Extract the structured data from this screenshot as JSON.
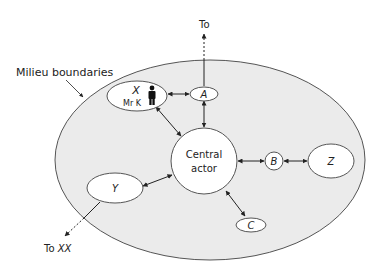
{
  "diagram": {
    "milieu_label": "Milieu boundaries",
    "central": {
      "line1": "Central",
      "line2": "actor"
    },
    "nodes": {
      "x": {
        "label": "X",
        "sublabel": "Mr K"
      },
      "a": {
        "label": "A"
      },
      "b": {
        "label": "B"
      },
      "z": {
        "label": "Z"
      },
      "y": {
        "label": "Y"
      },
      "c": {
        "label": "C"
      }
    },
    "external": {
      "to_top": "To",
      "to_xx_prefix": "To",
      "to_xx_target": "XX"
    },
    "colors": {
      "milieu_fill": "#ebebeb",
      "stroke": "#555555",
      "node_fill": "#ffffff"
    }
  }
}
